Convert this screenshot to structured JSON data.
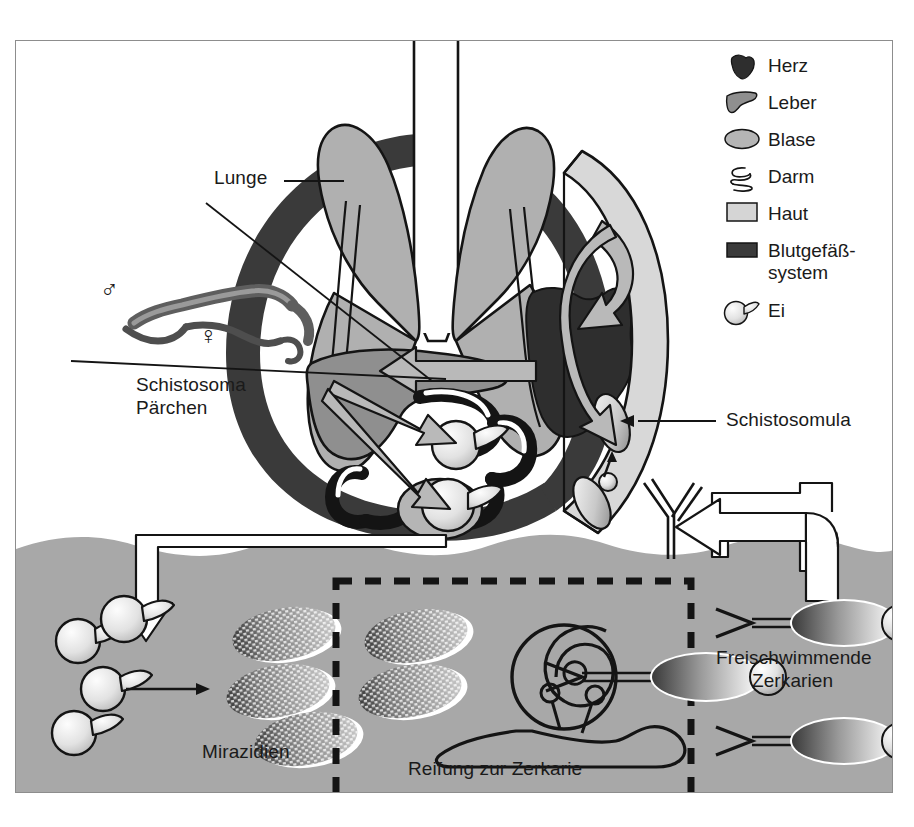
{
  "diagram": {
    "language": "de"
  },
  "legend": {
    "items": [
      {
        "icon": "heart-icon",
        "label": "Herz",
        "color": "#2e2e2e"
      },
      {
        "icon": "liver-icon",
        "label": "Leber",
        "color": "#8f8f8f"
      },
      {
        "icon": "bladder-icon",
        "label": "Blase",
        "color": "#b5b5b5"
      },
      {
        "icon": "intestine-icon",
        "label": "Darm",
        "color": "#ffffff"
      },
      {
        "icon": "skin-icon",
        "label": "Haut",
        "color": "#d5d5d5"
      },
      {
        "icon": "bloodvessel-icon",
        "label": "Blutgefäß-\nsystem",
        "color": "#3a3a3a"
      },
      {
        "icon": "egg-icon",
        "label": "Ei",
        "color": "#dcdcdc"
      }
    ],
    "blood_label_line1": "Blutgefäß-",
    "blood_label_line2": "system"
  },
  "labels": {
    "lunge": "Lunge",
    "schistosoma_line1": "Schistosoma",
    "schistosoma_line2": "Pärchen",
    "schistosomula": "Schistosomula",
    "mirazidien": "Mirazidien",
    "reifung": "Reifung zur Zerkarie",
    "zerkarien_line1": "Freischwimmende",
    "zerkarien_line2": "Zerkarien",
    "male_symbol": "♂",
    "female_symbol": "♀"
  },
  "colors": {
    "page_background": "#ffffff",
    "frame_border": "#8d8d8d",
    "water": "#a8a8a8",
    "blood_vessel": "#3a3a3a",
    "heart": "#2e2e2e",
    "lung": "#b0b0b0",
    "liver": "#8f8f8f",
    "skin": "#d8d8d8",
    "arrow_gray": "#b9b9b9",
    "outline": "#141414",
    "egg_light": "#efefef",
    "miracidium_dark": "#4a4a4a"
  },
  "structures": {
    "lung_left": "lung-left-lobe",
    "lung_right": "lung-right-lobe",
    "trachea": "trachea",
    "heart": "heart",
    "liver": "liver",
    "intestine": "intestine-loops",
    "bladder": "bladder",
    "blood_ring": "blood-vessel-ring",
    "skin_flap": "skin-flap",
    "snail": "snail",
    "water_body": "water-body",
    "maturation_box": "maturation-dashed-box"
  },
  "counts": {
    "eggs_in_water": 4,
    "miracidia_left": 3,
    "miracidia_in_box": 2,
    "cercariae_right": 3,
    "schistosomula_in_skin": 2,
    "eggs_in_abdomen": 2
  }
}
